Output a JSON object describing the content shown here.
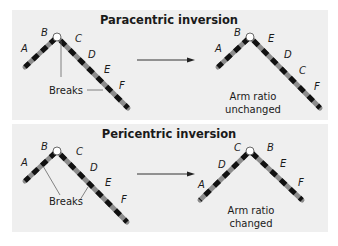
{
  "panels": [
    {
      "title": "Paracentric inversion",
      "before": {
        "labels": [
          "A",
          "B",
          "C",
          "D",
          "E",
          "F"
        ],
        "breaks_label": "Breaks"
      },
      "after": {
        "labels": [
          "A",
          "B",
          "E",
          "D",
          "C",
          "F"
        ],
        "result_line1": "Arm ratio",
        "result_line2": "unchanged"
      }
    },
    {
      "title": "Pericentric inversion",
      "before": {
        "labels": [
          "A",
          "B",
          "C",
          "D",
          "E",
          "F"
        ],
        "breaks_label": "Breaks"
      },
      "after": {
        "labels": [
          "A",
          "D",
          "C",
          "B",
          "E",
          "F"
        ],
        "result_line1": "Arm ratio",
        "result_line2": "changed"
      }
    }
  ],
  "colors": {
    "panel_bg": "#efefef",
    "band_dark": "#111111",
    "band_light": "#8c8c8c",
    "centromere": "#ffffff"
  }
}
